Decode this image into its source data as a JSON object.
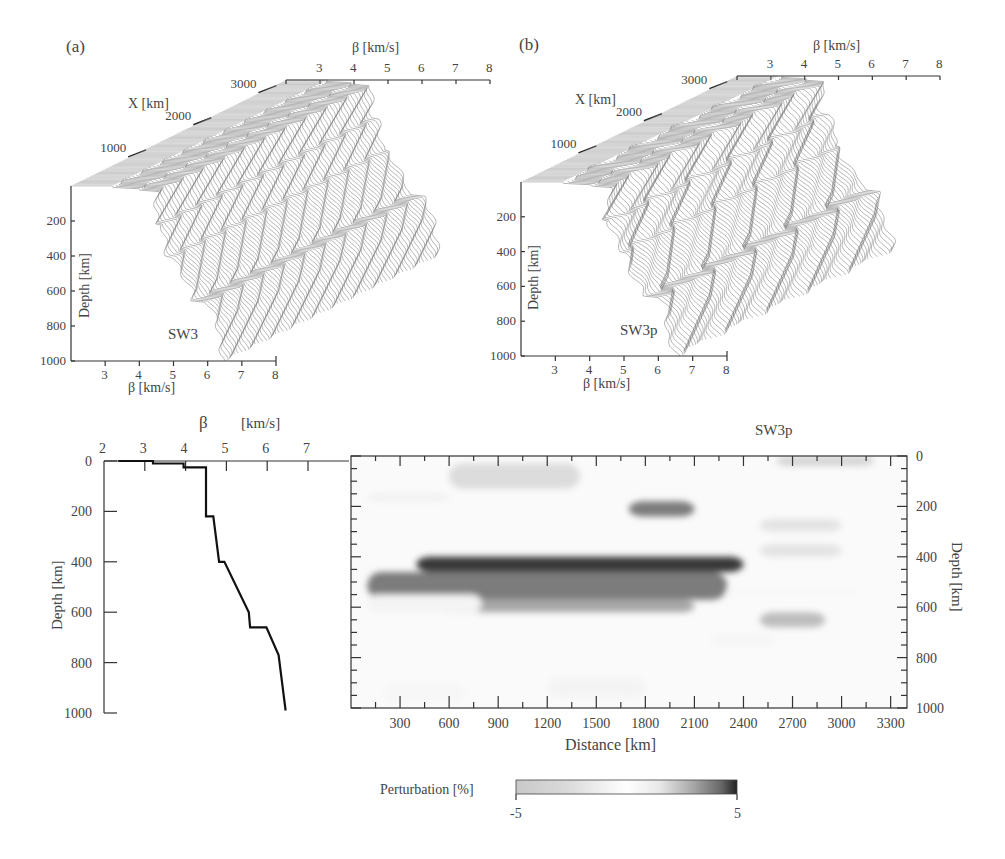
{
  "figure": {
    "panel_a": {
      "label": "(a)",
      "model_name": "SW3",
      "beta_axis_label": "β   [km/s]",
      "beta_ticks": [
        "3",
        "4",
        "5",
        "6",
        "7",
        "8"
      ],
      "x_axis_label": "X  [km]",
      "x_ticks": [
        "1000",
        "2000",
        "3000"
      ],
      "depth_axis_label": "Depth [km]",
      "depth_ticks": [
        "200",
        "400",
        "600",
        "800",
        "1000"
      ]
    },
    "panel_b": {
      "label": "(b)",
      "model_name": "SW3p",
      "beta_axis_label": "β   [km/s]",
      "beta_ticks": [
        "3",
        "4",
        "5",
        "6",
        "7",
        "8"
      ],
      "x_axis_label": "X  [km]",
      "x_ticks": [
        "1000",
        "2000",
        "3000"
      ],
      "depth_axis_label": "Depth [km]",
      "depth_ticks": [
        "200",
        "400",
        "600",
        "800",
        "1000"
      ]
    },
    "profile": {
      "beta_symbol": "β",
      "beta_unit": "[km/s]",
      "x_ticks": [
        "2",
        "3",
        "4",
        "5",
        "6",
        "7"
      ],
      "y_ticks": [
        "0",
        "200",
        "400",
        "600",
        "800",
        "1000"
      ],
      "ylabel": "Depth [km]"
    },
    "section": {
      "title": "SW3p",
      "xlabel": "Distance [km]",
      "ylabel": "Depth [km]",
      "x_ticks": [
        "300",
        "600",
        "900",
        "1200",
        "1500",
        "1800",
        "2100",
        "2400",
        "2700",
        "3000",
        "3300"
      ],
      "y_ticks": [
        "0",
        "200",
        "400",
        "600",
        "800",
        "1000"
      ]
    },
    "colorbar": {
      "label": "Perturbation [%]",
      "min_label": "-5",
      "max_label": "5"
    }
  },
  "chart_data": [
    {
      "type": "line",
      "title": "SW3 (a) – 3D stacked shear-velocity profiles",
      "xlabel": "β [km/s]",
      "ylabel": "Depth [km]",
      "zlabel": "X [km]",
      "xlim": [
        2,
        8
      ],
      "ylim": [
        0,
        1000
      ],
      "zlim": [
        0,
        3300
      ],
      "grid": false
    },
    {
      "type": "line",
      "title": "SW3p (b) – 3D stacked perturbed shear-velocity profiles",
      "xlabel": "β [km/s]",
      "ylabel": "Depth [km]",
      "zlabel": "X [km]",
      "xlim": [
        2,
        8
      ],
      "ylim": [
        0,
        1000
      ],
      "zlim": [
        0,
        3300
      ],
      "grid": false
    },
    {
      "type": "line",
      "title": "Reference shear-velocity profile",
      "xlabel": "β [km/s]",
      "ylabel": "Depth [km]",
      "xlim": [
        2,
        7.5
      ],
      "ylim": [
        1000,
        0
      ],
      "points": [
        {
          "beta": 2.35,
          "depth": 0
        },
        {
          "beta": 3.2,
          "depth": 0
        },
        {
          "beta": 3.2,
          "depth": 10
        },
        {
          "beta": 3.95,
          "depth": 10
        },
        {
          "beta": 3.95,
          "depth": 25
        },
        {
          "beta": 4.5,
          "depth": 25
        },
        {
          "beta": 4.5,
          "depth": 220
        },
        {
          "beta": 4.68,
          "depth": 220
        },
        {
          "beta": 4.82,
          "depth": 400
        },
        {
          "beta": 4.95,
          "depth": 400
        },
        {
          "beta": 5.55,
          "depth": 600
        },
        {
          "beta": 5.58,
          "depth": 660
        },
        {
          "beta": 5.98,
          "depth": 660
        },
        {
          "beta": 6.28,
          "depth": 770
        },
        {
          "beta": 6.45,
          "depth": 990
        }
      ]
    },
    {
      "type": "heatmap",
      "title": "SW3p",
      "xlabel": "Distance [km]",
      "ylabel": "Depth [km]",
      "xlim": [
        0,
        3400
      ],
      "ylim": [
        1000,
        0
      ],
      "colorbar": {
        "label": "Perturbation [%]",
        "range": [
          -5,
          5
        ],
        "colormap": "gray (light=-5, white=0, dark=+5)"
      },
      "anomalies": [
        {
          "x": [
            400,
            2400
          ],
          "depth": [
            400,
            460
          ],
          "value": 4.5
        },
        {
          "x": [
            100,
            2300
          ],
          "depth": [
            460,
            570
          ],
          "value": 3
        },
        {
          "x": [
            500,
            2100
          ],
          "depth": [
            570,
            620
          ],
          "value": 2
        },
        {
          "x": [
            1700,
            2100
          ],
          "depth": [
            180,
            240
          ],
          "value": 3
        },
        {
          "x": [
            600,
            1400
          ],
          "depth": [
            30,
            130
          ],
          "value": -2.5
        },
        {
          "x": [
            2600,
            3200
          ],
          "depth": [
            0,
            40
          ],
          "value": -3
        },
        {
          "x": [
            2500,
            3000
          ],
          "depth": [
            250,
            300
          ],
          "value": -2
        },
        {
          "x": [
            2500,
            3000
          ],
          "depth": [
            350,
            400
          ],
          "value": -2
        },
        {
          "x": [
            2500,
            2900
          ],
          "depth": [
            620,
            680
          ],
          "value": 1.5
        }
      ]
    }
  ]
}
